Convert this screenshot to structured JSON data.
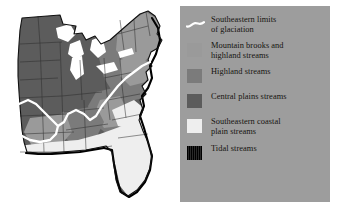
{
  "figure": {
    "kind": "thematic-map-with-legend",
    "page_background": "#ffffff"
  },
  "map": {
    "name": "eastern-united-states-stream-types-map",
    "region": "Eastern and central United States",
    "outline_color": "#000000",
    "state_border_color": "#2b2b2b",
    "glaciation_line_color": "#ffffff",
    "tidal_edge_color": "#000000",
    "fills": {
      "mountain_brooks": "#9a9a9a",
      "highland": "#7b7b7b",
      "central_plains": "#5c5c5c",
      "coastal_plain": "#eeeeee",
      "tidal": "#000000"
    }
  },
  "legend": {
    "panel_background": "#9d9d9d",
    "text_color": "#15130f",
    "entries": [
      {
        "id": "glaciation-limit",
        "symbol": "white-wavy-line",
        "color": "#ffffff",
        "line1": "Southeastern limits",
        "line2": "of glaciation"
      },
      {
        "id": "mountain-brooks",
        "symbol": "color-swatch",
        "color": "#9a9a9a",
        "line1": "Mountain brooks and",
        "line2": "highland streams"
      },
      {
        "id": "highland-streams",
        "symbol": "color-swatch",
        "color": "#7b7b7b",
        "line1": "Highland streams",
        "line2": ""
      },
      {
        "id": "central-plains-streams",
        "symbol": "color-swatch",
        "color": "#5c5c5c",
        "line1": "Central plains streams",
        "line2": ""
      },
      {
        "id": "southeastern-coastal-plain-streams",
        "symbol": "color-swatch",
        "color": "#eeeeee",
        "line1": "Southeastern coastal",
        "line2": "plain streams"
      },
      {
        "id": "tidal-streams",
        "symbol": "hatched-black-swatch",
        "color": "#000000",
        "line1": "Tidal streams",
        "line2": ""
      }
    ]
  }
}
